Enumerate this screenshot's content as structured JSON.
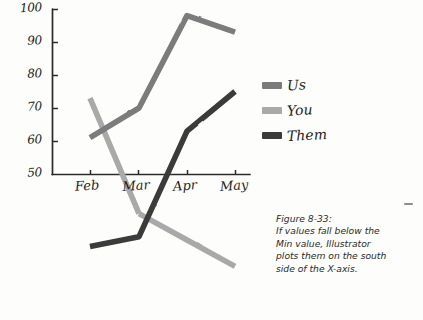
{
  "figure": {
    "caption_lines": [
      "Figure 8-33:",
      "If values fall below the",
      "Min value, Illustrator",
      "plots them on the south",
      "side of the X-axis."
    ]
  },
  "legend": {
    "position": "right",
    "items": [
      {
        "label": "Us",
        "color": "#7b7b7b"
      },
      {
        "label": "You",
        "color": "#a9a9a9"
      },
      {
        "label": "Them",
        "color": "#3b3b3b"
      }
    ]
  },
  "axis": {
    "y_ticks": [
      "100",
      "90",
      "80",
      "70",
      "60",
      "50"
    ],
    "x_ticks": [
      "Feb",
      "Mar",
      "Apr",
      "May"
    ]
  },
  "chart_data": {
    "type": "line",
    "title": "",
    "xlabel": "",
    "ylabel": "",
    "categories": [
      "Feb",
      "Mar",
      "Apr",
      "May"
    ],
    "ylim": [
      50,
      100
    ],
    "y_tick_values": [
      50,
      60,
      70,
      80,
      90,
      100
    ],
    "grid": false,
    "legend_position": "right",
    "note": "Values below the Min (50) are plotted on the south side of the X-axis.",
    "series": [
      {
        "name": "Us",
        "color": "#7b7b7b",
        "values": [
          61,
          70,
          98,
          93
        ]
      },
      {
        "name": "You",
        "color": "#a9a9a9",
        "values": [
          73,
          38,
          30,
          22
        ]
      },
      {
        "name": "Them",
        "color": "#3b3b3b",
        "values": [
          28,
          31,
          63,
          75
        ]
      }
    ]
  }
}
